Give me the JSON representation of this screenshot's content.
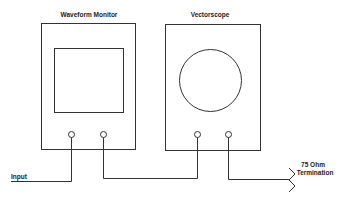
{
  "diagram": {
    "devices": [
      {
        "id": "waveform-monitor",
        "title": "Waveform Monitor",
        "screen_shape": "rectangle",
        "connectors": 2
      },
      {
        "id": "vectorscope",
        "title": "Vectorscope",
        "screen_shape": "circle",
        "connectors": 2
      }
    ],
    "labels": {
      "input": "Input",
      "termination_line1": "75 Ohm",
      "termination_line2": "Termination"
    },
    "connections": [
      {
        "from": "Input",
        "to": "waveform-monitor connector 1"
      },
      {
        "from": "waveform-monitor connector 2",
        "to": "vectorscope connector 1"
      },
      {
        "from": "vectorscope connector 2",
        "to": "75 Ohm Termination"
      }
    ],
    "colors": {
      "line": "#333333",
      "background": "#ffffff",
      "text": "#222222"
    }
  }
}
